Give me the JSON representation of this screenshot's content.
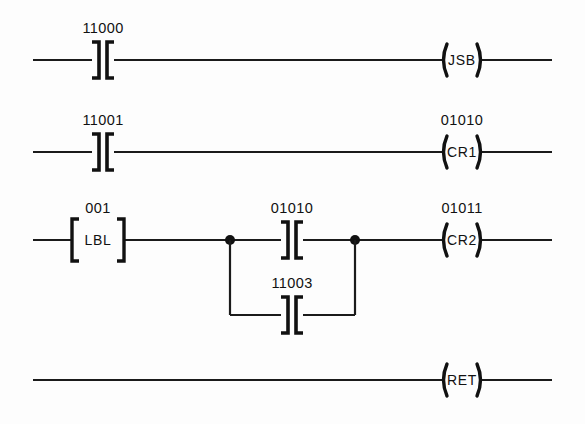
{
  "diagram": {
    "type": "ladder-logic",
    "background_color": "#fdfdfd",
    "line_color": "#111111",
    "rungs": [
      {
        "id": "rung-1",
        "y": 60,
        "elements": [
          {
            "kind": "contact",
            "subtype": "normally-open",
            "address": "11000",
            "x": 103
          },
          {
            "kind": "coil",
            "address": "",
            "label": "JSB",
            "x": 462
          }
        ]
      },
      {
        "id": "rung-2",
        "y": 152,
        "elements": [
          {
            "kind": "contact",
            "subtype": "normally-open",
            "address": "11001",
            "x": 103
          },
          {
            "kind": "coil",
            "address": "01010",
            "label": "CR1",
            "x": 462
          }
        ]
      },
      {
        "id": "rung-3",
        "y": 240,
        "elements": [
          {
            "kind": "block",
            "address": "001",
            "label": "LBL",
            "x": 98
          },
          {
            "kind": "junction",
            "x": 230
          },
          {
            "kind": "contact",
            "subtype": "normally-open",
            "address": "01010",
            "x": 292
          },
          {
            "kind": "junction",
            "x": 355
          },
          {
            "kind": "coil",
            "address": "01011",
            "label": "CR2",
            "x": 462
          }
        ],
        "branch": {
          "id": "branch-1",
          "y": 315,
          "x_start": 230,
          "x_end": 355,
          "elements": [
            {
              "kind": "contact",
              "subtype": "normally-open",
              "address": "11003",
              "x": 292
            }
          ]
        }
      },
      {
        "id": "rung-4",
        "y": 380,
        "elements": [
          {
            "kind": "coil",
            "address": "",
            "label": "RET",
            "x": 462
          }
        ]
      }
    ],
    "rail_x_start": 33,
    "rail_x_end": 552
  }
}
